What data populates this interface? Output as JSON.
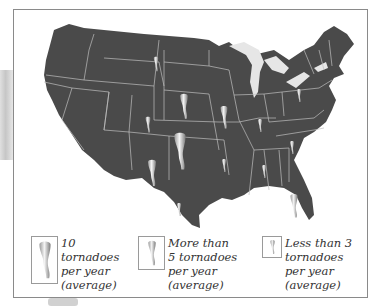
{
  "map": {
    "title": "Average annual tornadoes in the United States",
    "colors": {
      "land": "#4a4a4a",
      "borders": "#bfbfbf",
      "lakes": "#e6e6e6",
      "tornado_light": "#f2f2f2",
      "tornado_dark": "#8a8a8a"
    },
    "markers": [
      {
        "region": "North Dakota",
        "size": "small"
      },
      {
        "region": "Nebraska/South Dakota",
        "size": "medium"
      },
      {
        "region": "Iowa/Illinois",
        "size": "medium"
      },
      {
        "region": "Colorado",
        "size": "small"
      },
      {
        "region": "Oklahoma/Kansas",
        "size": "large"
      },
      {
        "region": "Texas Panhandle",
        "size": "medium"
      },
      {
        "region": "South Texas",
        "size": "small"
      },
      {
        "region": "Arkansas",
        "size": "small"
      },
      {
        "region": "Indiana",
        "size": "small"
      },
      {
        "region": "Pennsylvania",
        "size": "small"
      },
      {
        "region": "North Carolina",
        "size": "small"
      },
      {
        "region": "Alabama",
        "size": "small"
      },
      {
        "region": "Florida",
        "size": "medium"
      }
    ]
  },
  "legend": {
    "items": [
      {
        "label": "10 tornadoes per year (average)",
        "size": "large"
      },
      {
        "label": "More than 5 tornadoes per year (average)",
        "size": "medium"
      },
      {
        "label": "Less than 3 tornadoes per year (average)",
        "size": "small"
      }
    ]
  }
}
